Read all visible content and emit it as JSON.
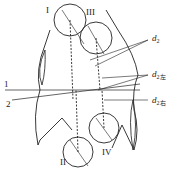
{
  "diagram": {
    "roller_labels": [
      "I",
      "III",
      "II",
      "IV"
    ],
    "line_labels": [
      "1",
      "2"
    ],
    "diameter_labels": [
      {
        "base": "d",
        "sub": "2"
      },
      {
        "base": "d",
        "sub": "2左"
      },
      {
        "base": "d",
        "sub": "2右"
      }
    ],
    "caption": "",
    "colors": {
      "stroke": "#222222",
      "background": "#ffffff"
    }
  }
}
